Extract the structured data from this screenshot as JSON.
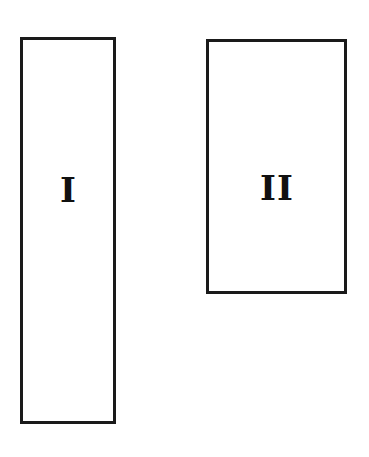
{
  "diagram": {
    "shapes": [
      {
        "type": "rectangle",
        "label": "I",
        "x": 20,
        "y": 37,
        "width": 96,
        "height": 387
      },
      {
        "type": "rectangle",
        "label": "II",
        "x": 206,
        "y": 39,
        "width": 141,
        "height": 255
      }
    ],
    "colors": {
      "stroke": "#1a1a1a",
      "fill": "#ffffff",
      "text": "#111111"
    }
  }
}
